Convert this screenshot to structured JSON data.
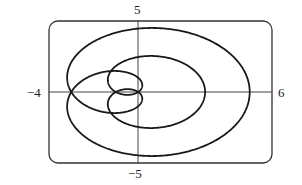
{
  "chart_data": {
    "type": "line",
    "title": "",
    "xlabel": "",
    "ylabel": "",
    "xlim": [
      -4,
      6
    ],
    "ylim": [
      -5,
      5
    ],
    "grid": false,
    "legend": null,
    "tick_labels": {
      "x_min": "−4",
      "x_max": "6",
      "y_max": "5",
      "y_min": "−5"
    },
    "series": [
      {
        "name": "polar curve",
        "kind": "polar",
        "equation": "r = 1 + 4cos(θ/3)",
        "a": 1,
        "b": 4,
        "divisor": 3,
        "theta_range": [
          0,
          18.8496
        ],
        "key_points": [
          {
            "theta": "0",
            "x": 5,
            "y": 0
          },
          {
            "theta": "π/2",
            "x": 0,
            "y": 4.46
          },
          {
            "theta": "π",
            "x": -3,
            "y": 0
          },
          {
            "theta": "2π",
            "x": -1,
            "y": 0
          },
          {
            "theta": "3π",
            "x": 3,
            "y": 0
          },
          {
            "theta": "4π",
            "x": -1,
            "y": 0
          },
          {
            "theta": "5π",
            "x": -3,
            "y": 0
          },
          {
            "theta": "6π",
            "x": 5,
            "y": 0
          }
        ]
      }
    ]
  },
  "colors": {
    "curve": "#1a1a1a",
    "frame": "#333333",
    "axes": "#444444"
  }
}
